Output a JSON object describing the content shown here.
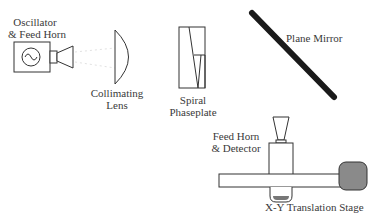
{
  "diagram": {
    "labels": {
      "oscillator_line1": "Oscillator",
      "oscillator_line2": "& Feed Horn",
      "lens_line1": "Collimating",
      "lens_line2": "Lens",
      "phaseplate_line1": "Spiral",
      "phaseplate_line2": "Phaseplate",
      "mirror": "Plane Mirror",
      "detector_line1": "Feed Horn",
      "detector_line2": "& Detector",
      "stage": "X-Y Translation Stage"
    },
    "colors": {
      "stroke": "#333333",
      "mirror": "#1a1a1a",
      "knob_fill": "#8a8a8a",
      "beam": "#d8d8d8"
    }
  }
}
